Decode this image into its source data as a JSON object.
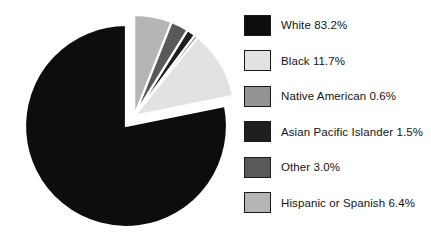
{
  "chart_data": {
    "type": "pie",
    "title": "",
    "subtitle": "",
    "xlabel": "",
    "ylabel": "",
    "legend_position": "right",
    "grid": false,
    "units": "percent",
    "total": 106.4,
    "exploded_group_label": "minority-slices",
    "categories": [
      "White",
      "Black",
      "Native American",
      "Asian Pacific Islander",
      "Other",
      "Hispanic or Spanish"
    ],
    "values": [
      83.2,
      11.7,
      0.6,
      1.5,
      3.0,
      6.4
    ],
    "value_labels": [
      "83.2%",
      "11.7%",
      "0.6%",
      "1.5%",
      "3.0%",
      "6.4%"
    ],
    "colors": [
      "#0d0d0d",
      "#e2e2e2",
      "#949494",
      "#1f1f1f",
      "#595959",
      "#b5b5b5"
    ],
    "exploded": [
      false,
      true,
      true,
      true,
      true,
      true
    ],
    "slices": [
      {
        "name": "White",
        "value": 83.2,
        "label": "White 83.2%",
        "color": "#0d0d0d",
        "exploded": false
      },
      {
        "name": "Black",
        "value": 11.7,
        "label": "Black 11.7%",
        "color": "#e2e2e2",
        "exploded": true
      },
      {
        "name": "Native American",
        "value": 0.6,
        "label": "Native American 0.6%",
        "color": "#949494",
        "exploded": true
      },
      {
        "name": "Asian Pacific Islander",
        "value": 1.5,
        "label": "Asian Pacific Islander 1.5%",
        "color": "#1f1f1f",
        "exploded": true
      },
      {
        "name": "Other",
        "value": 3.0,
        "label": "Other 3.0%",
        "color": "#595959",
        "exploded": true
      },
      {
        "name": "Hispanic or Spanish",
        "value": 6.4,
        "label": "Hispanic or Spanish 6.4%",
        "color": "#b5b5b5",
        "exploded": true
      }
    ]
  },
  "legend": {
    "items": [
      {
        "label": "White 83.2%",
        "color": "#0d0d0d"
      },
      {
        "label": "Black 11.7%",
        "color": "#e2e2e2"
      },
      {
        "label": "Native American 0.6%",
        "color": "#949494"
      },
      {
        "label": "Asian Pacific Islander 1.5%",
        "color": "#1f1f1f"
      },
      {
        "label": "Other 3.0%",
        "color": "#595959"
      },
      {
        "label": "Hispanic or Spanish 6.4%",
        "color": "#b5b5b5"
      }
    ]
  },
  "style": {
    "background": "#ffffff",
    "slice_outline": "#ffffff",
    "swatch_border": "#1a1a1a",
    "text_color": "#141414"
  }
}
